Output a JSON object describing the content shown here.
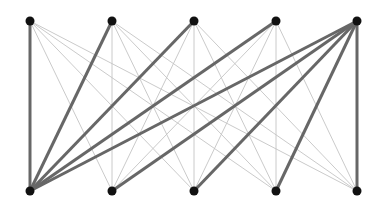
{
  "diagram": {
    "type": "complete-bipartite-graph",
    "colors": {
      "background": "#ffffff",
      "node": "#111111",
      "thin_edge": "#c4c4c4",
      "thick_edge": "#676767"
    },
    "top_nodes": [
      {
        "id": "t1",
        "x": 30,
        "y": 21
      },
      {
        "id": "t2",
        "x": 112,
        "y": 21
      },
      {
        "id": "t3",
        "x": 194,
        "y": 21
      },
      {
        "id": "t4",
        "x": 276,
        "y": 21
      },
      {
        "id": "t5",
        "x": 357,
        "y": 21
      }
    ],
    "bottom_nodes": [
      {
        "id": "b1",
        "x": 30,
        "y": 191
      },
      {
        "id": "b2",
        "x": 112,
        "y": 191
      },
      {
        "id": "b3",
        "x": 194,
        "y": 191
      },
      {
        "id": "b4",
        "x": 276,
        "y": 191
      },
      {
        "id": "b5",
        "x": 357,
        "y": 191
      }
    ],
    "highlighted_edges": [
      [
        "t1",
        "b1"
      ],
      [
        "t2",
        "b1"
      ],
      [
        "t3",
        "b1"
      ],
      [
        "t4",
        "b1"
      ],
      [
        "t5",
        "b1"
      ],
      [
        "t5",
        "b2"
      ],
      [
        "t5",
        "b3"
      ],
      [
        "t5",
        "b4"
      ],
      [
        "t5",
        "b5"
      ]
    ]
  }
}
